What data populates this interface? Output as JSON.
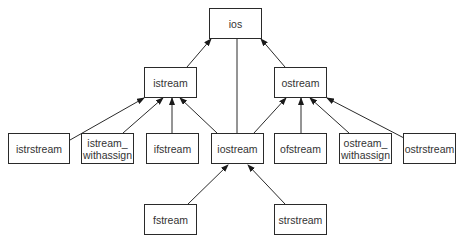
{
  "diagram": {
    "nodes": [
      {
        "id": "ios",
        "label": "ios",
        "x": 209,
        "y": 8,
        "w": 53,
        "h": 31
      },
      {
        "id": "istream",
        "label": "istream",
        "x": 144,
        "y": 67,
        "w": 53,
        "h": 31
      },
      {
        "id": "ostream",
        "label": "ostream",
        "x": 274,
        "y": 67,
        "w": 53,
        "h": 31
      },
      {
        "id": "istrstream",
        "label": "istrstream",
        "x": 8,
        "y": 133,
        "w": 62,
        "h": 31
      },
      {
        "id": "istream_withassign",
        "label": "istream_\nwithassign",
        "x": 81,
        "y": 133,
        "w": 53,
        "h": 31
      },
      {
        "id": "ifstream",
        "label": "ifstream",
        "x": 146,
        "y": 133,
        "w": 53,
        "h": 31
      },
      {
        "id": "iostream",
        "label": "iostream",
        "x": 211,
        "y": 133,
        "w": 53,
        "h": 31
      },
      {
        "id": "ofstream",
        "label": "ofstream",
        "x": 274,
        "y": 133,
        "w": 53,
        "h": 31
      },
      {
        "id": "ostream_withassign",
        "label": "ostream_\nwithassign",
        "x": 339,
        "y": 133,
        "w": 53,
        "h": 31
      },
      {
        "id": "ostrstream",
        "label": "ostrstream",
        "x": 403,
        "y": 133,
        "w": 53,
        "h": 31
      },
      {
        "id": "fstream",
        "label": "fstream",
        "x": 144,
        "y": 204,
        "w": 53,
        "h": 31
      },
      {
        "id": "strstream",
        "label": "strstream",
        "x": 274,
        "y": 204,
        "w": 53,
        "h": 31
      }
    ],
    "edges": [
      {
        "from": "istream",
        "to": "ios",
        "x1": 187,
        "y1": 67,
        "x2": 211,
        "y2": 39,
        "arrow": true
      },
      {
        "from": "ostream",
        "to": "ios",
        "x1": 285,
        "y1": 67,
        "x2": 261,
        "y2": 39,
        "arrow": true
      },
      {
        "from": "iostream",
        "to": "ios",
        "x1": 237,
        "y1": 133,
        "x2": 237,
        "y2": 39,
        "arrow": false
      },
      {
        "from": "istrstream",
        "to": "istream",
        "x1": 70,
        "y1": 140,
        "x2": 144,
        "y2": 98,
        "arrow": true
      },
      {
        "from": "istream_withassign",
        "to": "istream",
        "x1": 123,
        "y1": 133,
        "x2": 163,
        "y2": 98,
        "arrow": true
      },
      {
        "from": "ifstream",
        "to": "istream",
        "x1": 172,
        "y1": 133,
        "x2": 172,
        "y2": 98,
        "arrow": true
      },
      {
        "from": "iostream",
        "to": "istream",
        "x1": 217,
        "y1": 133,
        "x2": 180,
        "y2": 98,
        "arrow": true
      },
      {
        "from": "iostream",
        "to": "ostream",
        "x1": 254,
        "y1": 133,
        "x2": 286,
        "y2": 98,
        "arrow": true
      },
      {
        "from": "ofstream",
        "to": "ostream",
        "x1": 301,
        "y1": 133,
        "x2": 301,
        "y2": 98,
        "arrow": true
      },
      {
        "from": "ostream_withassign",
        "to": "ostream",
        "x1": 349,
        "y1": 133,
        "x2": 310,
        "y2": 98,
        "arrow": true
      },
      {
        "from": "ostrstream",
        "to": "ostream",
        "x1": 404,
        "y1": 138,
        "x2": 327,
        "y2": 98,
        "arrow": true
      },
      {
        "from": "fstream",
        "to": "iostream",
        "x1": 188,
        "y1": 204,
        "x2": 228,
        "y2": 165,
        "arrow": true
      },
      {
        "from": "strstream",
        "to": "iostream",
        "x1": 285,
        "y1": 204,
        "x2": 248,
        "y2": 165,
        "arrow": true
      }
    ],
    "colors": {
      "stroke": "#2a2a2a",
      "text": "#333333",
      "background": "#ffffff"
    }
  }
}
